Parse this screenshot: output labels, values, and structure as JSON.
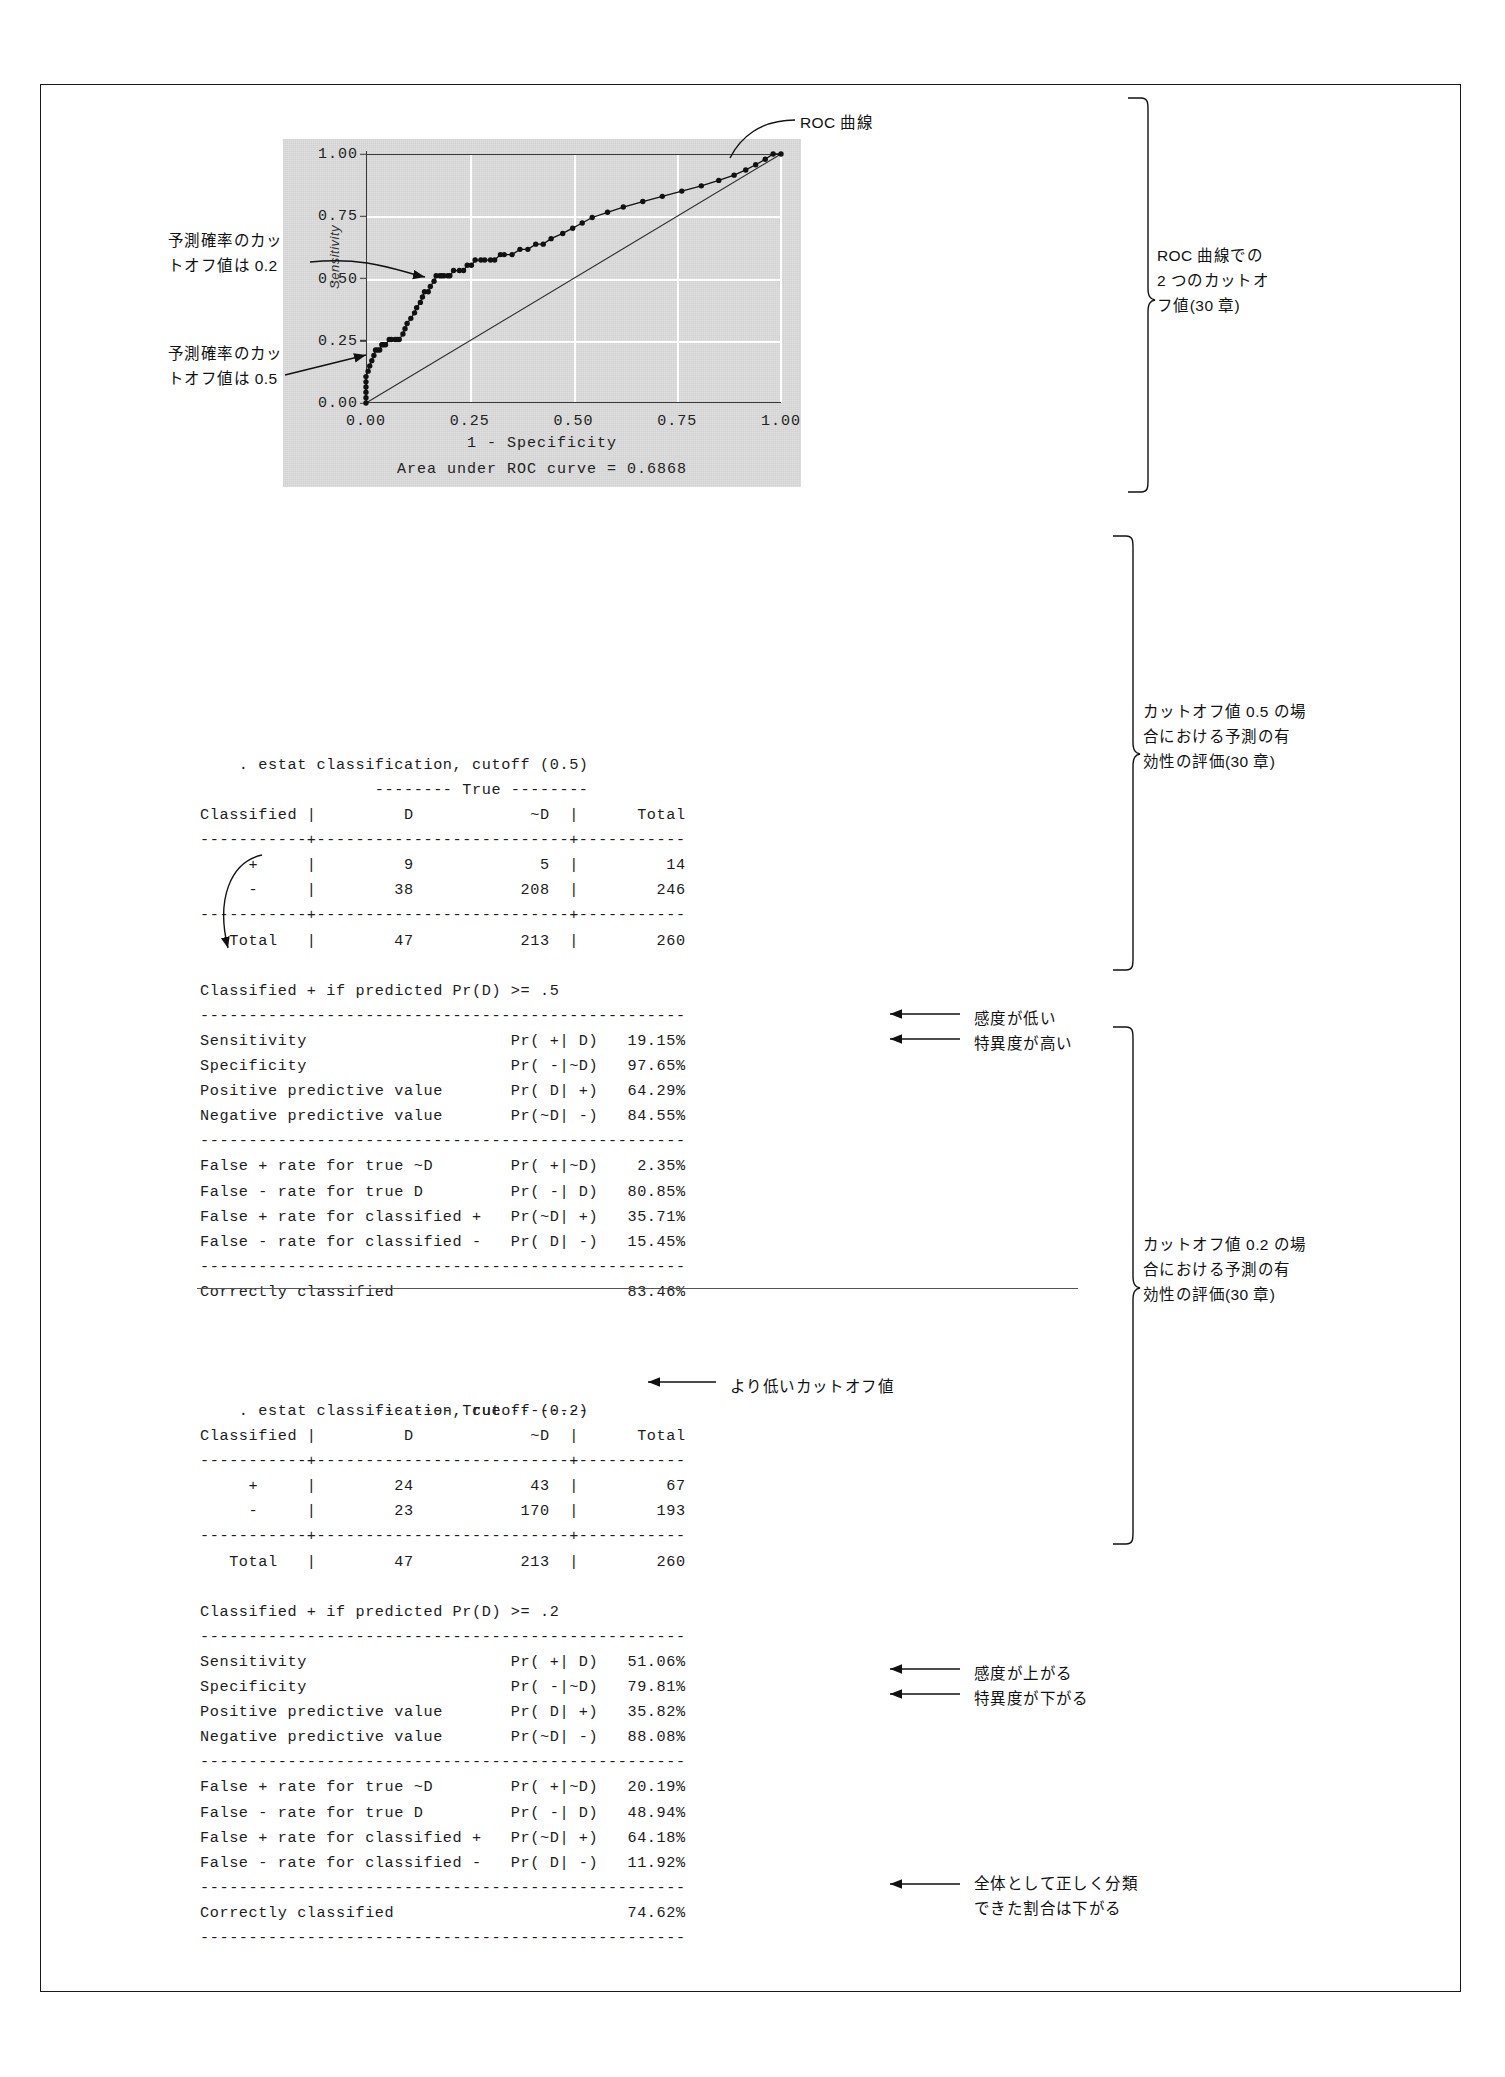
{
  "document": {
    "title": "ROC curve and estat classification output with cutoff 0.5 and 0.2"
  },
  "chart_data": {
    "type": "line",
    "title": "",
    "xlabel": "1 - Specificity",
    "ylabel": "Sensitivity",
    "xlim": [
      0,
      1
    ],
    "ylim": [
      0,
      1
    ],
    "xticks": [
      "0.00",
      "0.25",
      "0.50",
      "0.75",
      "1.00"
    ],
    "yticks": [
      "0.00",
      "0.25",
      "0.50",
      "0.75",
      "1.00"
    ],
    "grid": true,
    "legend": null,
    "auc_label": "Area under ROC curve = 0.6868",
    "auc_value": 0.6868,
    "reference_line": {
      "name": "diagonal reference",
      "from": [
        0,
        0
      ],
      "to": [
        1,
        1
      ]
    },
    "series": [
      {
        "name": "ROC curve",
        "x": [
          0.0,
          0.0,
          0.0,
          0.0,
          0.0,
          0.0,
          0.005,
          0.009,
          0.014,
          0.019,
          0.023,
          0.028,
          0.033,
          0.038,
          0.042,
          0.047,
          0.056,
          0.061,
          0.07,
          0.075,
          0.08,
          0.089,
          0.094,
          0.099,
          0.108,
          0.117,
          0.122,
          0.131,
          0.136,
          0.141,
          0.15,
          0.155,
          0.164,
          0.169,
          0.178,
          0.183,
          0.188,
          0.197,
          0.202,
          0.211,
          0.225,
          0.235,
          0.244,
          0.254,
          0.263,
          0.277,
          0.286,
          0.3,
          0.31,
          0.324,
          0.333,
          0.352,
          0.371,
          0.39,
          0.409,
          0.427,
          0.446,
          0.474,
          0.498,
          0.521,
          0.545,
          0.582,
          0.62,
          0.667,
          0.714,
          0.761,
          0.808,
          0.85,
          0.887,
          0.915,
          0.939,
          0.962,
          0.981,
          1.0
        ],
        "y": [
          0.0,
          0.021,
          0.043,
          0.064,
          0.085,
          0.106,
          0.128,
          0.149,
          0.17,
          0.191,
          0.213,
          0.213,
          0.213,
          0.234,
          0.234,
          0.234,
          0.255,
          0.255,
          0.255,
          0.255,
          0.255,
          0.277,
          0.298,
          0.319,
          0.34,
          0.362,
          0.383,
          0.404,
          0.426,
          0.447,
          0.447,
          0.468,
          0.489,
          0.511,
          0.511,
          0.511,
          0.511,
          0.511,
          0.511,
          0.532,
          0.532,
          0.532,
          0.553,
          0.553,
          0.574,
          0.574,
          0.574,
          0.574,
          0.574,
          0.596,
          0.596,
          0.596,
          0.617,
          0.617,
          0.638,
          0.638,
          0.66,
          0.681,
          0.702,
          0.723,
          0.745,
          0.766,
          0.787,
          0.809,
          0.83,
          0.851,
          0.872,
          0.894,
          0.915,
          0.936,
          0.957,
          0.979,
          1.0,
          1.0
        ]
      }
    ],
    "annotations": [
      {
        "name": "cutoff-0.2-marker",
        "text": "予測確率のカットオフ値は 0.2",
        "points_to": [
          0.18,
          0.52
        ]
      },
      {
        "name": "cutoff-0.5-marker",
        "text": "予測確率のカットオフ値は 0.5",
        "points_to": [
          0.012,
          0.21
        ]
      },
      {
        "name": "roc-curve-label",
        "text": "ROC 曲線",
        "points_to": [
          0.82,
          0.97
        ]
      }
    ]
  },
  "annotations": {
    "roc_curve_label": "ROC 曲線",
    "cutoff02_left": "予測確率のカッ\nトオフ値は 0.2",
    "cutoff05_left": "予測確率のカッ\nトオフ値は 0.5",
    "right_brace_chart": "ROC 曲線での\n2 つのカットオ\nフ値(30 章)",
    "right_brace_block1": "カットオフ値 0.5 の場\n合における予測の有\n効性の評価(30 章)",
    "right_brace_block2": "カットオフ値 0.2 の場\n合における予測の有\n効性の評価(30 章)",
    "sensitivity_low": "感度が低い",
    "specificity_high": "特異度が高い",
    "lower_cutoff": "より低いカットオフ値",
    "sensitivity_up": "感度が上がる",
    "specificity_down": "特異度が下がる",
    "correctly_classified_down": "全体として正しく分類\nできた割合は下がる"
  },
  "block1": {
    "command": ". estat classification, cutoff (0.5)",
    "lines": [
      "                  -------- True --------",
      "Classified |         D            ~D  |      Total",
      "-----------+--------------------------+-----------",
      "     +     |         9             5  |         14",
      "     -     |        38           208  |        246",
      "-----------+--------------------------+-----------",
      "   Total   |        47           213  |        260",
      "",
      "Classified + if predicted Pr(D) >= .5",
      "--------------------------------------------------",
      "Sensitivity                     Pr( +| D)   19.15%",
      "Specificity                     Pr( -|~D)   97.65%",
      "Positive predictive value       Pr( D| +)   64.29%",
      "Negative predictive value       Pr(~D| -)   84.55%",
      "--------------------------------------------------",
      "False + rate for true ~D        Pr( +|~D)    2.35%",
      "False - rate for true D         Pr( -| D)   80.85%",
      "False + rate for classified +   Pr(~D| +)   35.71%",
      "False - rate for classified -   Pr( D| -)   15.45%",
      "--------------------------------------------------",
      "Correctly classified                        83.46%"
    ],
    "table": {
      "header": [
        "Classified",
        "D",
        "~D",
        "Total"
      ],
      "rows": [
        [
          "+",
          "9",
          "5",
          "14"
        ],
        [
          "-",
          "38",
          "208",
          "246"
        ],
        [
          "Total",
          "47",
          "213",
          "260"
        ]
      ]
    },
    "stats": [
      {
        "label": "Sensitivity",
        "expr": "Pr( +| D)",
        "value": "19.15%"
      },
      {
        "label": "Specificity",
        "expr": "Pr( -|~D)",
        "value": "97.65%"
      },
      {
        "label": "Positive predictive value",
        "expr": "Pr( D| +)",
        "value": "64.29%"
      },
      {
        "label": "Negative predictive value",
        "expr": "Pr(~D| -)",
        "value": "84.55%"
      },
      {
        "label": "False + rate for true ~D",
        "expr": "Pr( +|~D)",
        "value": "2.35%"
      },
      {
        "label": "False - rate for true D",
        "expr": "Pr( -| D)",
        "value": "80.85%"
      },
      {
        "label": "False + rate for classified +",
        "expr": "Pr(~D| +)",
        "value": "35.71%"
      },
      {
        "label": "False - rate for classified -",
        "expr": "Pr( D| -)",
        "value": "15.45%"
      },
      {
        "label": "Correctly classified",
        "expr": "",
        "value": "83.46%"
      }
    ]
  },
  "block2": {
    "command": ". estat classification, cutoff (0.2)",
    "lines": [
      "                  -------- True --------",
      "Classified |         D            ~D  |      Total",
      "-----------+--------------------------+-----------",
      "     +     |        24            43  |         67",
      "     -     |        23           170  |        193",
      "-----------+--------------------------+-----------",
      "   Total   |        47           213  |        260",
      "",
      "Classified + if predicted Pr(D) >= .2",
      "--------------------------------------------------",
      "Sensitivity                     Pr( +| D)   51.06%",
      "Specificity                     Pr( -|~D)   79.81%",
      "Positive predictive value       Pr( D| +)   35.82%",
      "Negative predictive value       Pr(~D| -)   88.08%",
      "--------------------------------------------------",
      "False + rate for true ~D        Pr( +|~D)   20.19%",
      "False - rate for true D         Pr( -| D)   48.94%",
      "False + rate for classified +   Pr(~D| +)   64.18%",
      "False - rate for classified -   Pr( D| -)   11.92%",
      "--------------------------------------------------",
      "Correctly classified                        74.62%",
      "--------------------------------------------------"
    ],
    "table": {
      "header": [
        "Classified",
        "D",
        "~D",
        "Total"
      ],
      "rows": [
        [
          "+",
          "24",
          "43",
          "67"
        ],
        [
          "-",
          "23",
          "170",
          "193"
        ],
        [
          "Total",
          "47",
          "213",
          "260"
        ]
      ]
    },
    "stats": [
      {
        "label": "Sensitivity",
        "expr": "Pr( +| D)",
        "value": "51.06%"
      },
      {
        "label": "Specificity",
        "expr": "Pr( -|~D)",
        "value": "79.81%"
      },
      {
        "label": "Positive predictive value",
        "expr": "Pr( D| +)",
        "value": "35.82%"
      },
      {
        "label": "Negative predictive value",
        "expr": "Pr(~D| -)",
        "value": "88.08%"
      },
      {
        "label": "False + rate for true ~D",
        "expr": "Pr( +|~D)",
        "value": "20.19%"
      },
      {
        "label": "False - rate for true D",
        "expr": "Pr( -| D)",
        "value": "48.94%"
      },
      {
        "label": "False + rate for classified +",
        "expr": "Pr(~D| +)",
        "value": "64.18%"
      },
      {
        "label": "False - rate for classified -",
        "expr": "Pr( D| -)",
        "value": "11.92%"
      },
      {
        "label": "Correctly classified",
        "expr": "",
        "value": "74.62%"
      }
    ]
  }
}
